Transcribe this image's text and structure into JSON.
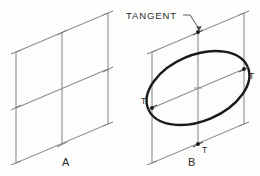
{
  "figure": {
    "background_color": "#fdfdfc",
    "construction_line_color": "#8d8d90",
    "ellipse_color": "#1a1a1a",
    "text_color": "#2b2b2b"
  },
  "callout": {
    "label": "TANGENT",
    "leader_from": [
      186,
      20
    ],
    "leader_to": [
      200,
      28
    ]
  },
  "panels": [
    {
      "id": "A",
      "label": "A",
      "label_pos": [
        66,
        166
      ],
      "has_ellipse": false,
      "parallelogram": [
        [
          16,
          52
        ],
        [
          108,
          13
        ],
        [
          108,
          124
        ],
        [
          16,
          163
        ]
      ],
      "centerline_vertical": [
        [
          62,
          32
        ],
        [
          62,
          144
        ]
      ],
      "centerline_horizontal": [
        [
          16,
          108
        ],
        [
          108,
          69
        ]
      ],
      "tangent_ticks": [
        [
          62,
          32
        ],
        [
          108,
          69
        ],
        [
          62,
          144
        ],
        [
          16,
          108
        ]
      ],
      "tangent_point_labels": []
    },
    {
      "id": "B",
      "label": "B",
      "label_pos": [
        192,
        166
      ],
      "has_ellipse": true,
      "parallelogram": [
        [
          152,
          52
        ],
        [
          244,
          13
        ],
        [
          244,
          124
        ],
        [
          152,
          163
        ]
      ],
      "centerline_vertical": [
        [
          198,
          32
        ],
        [
          198,
          144
        ]
      ],
      "centerline_horizontal": [
        [
          152,
          108
        ],
        [
          244,
          69
        ]
      ],
      "tangent_ticks": [
        [
          198,
          32
        ],
        [
          244,
          69
        ],
        [
          198,
          144
        ],
        [
          152,
          108
        ]
      ],
      "ellipse": {
        "center": [
          198,
          88
        ],
        "rx": 54,
        "ry": 33,
        "rotation_deg": -23
      },
      "tangent_point_labels": [
        {
          "text": "T",
          "pos": [
            250,
            76
          ]
        },
        {
          "text": "T",
          "pos": [
            203,
            152
          ]
        },
        {
          "text": "T",
          "pos": [
            140,
            102
          ]
        }
      ]
    }
  ]
}
